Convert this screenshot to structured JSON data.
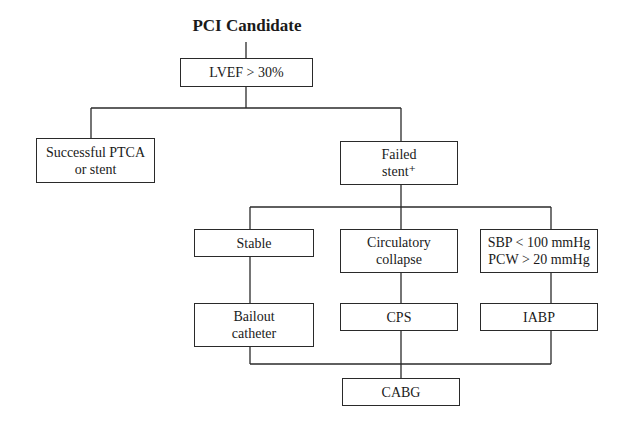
{
  "diagram": {
    "title": "PCI Candidate",
    "nodes": {
      "lvef": "LVEF > 30%",
      "successful": "Successful PTCA\nor stent",
      "failed": "Failed\nstent⁺",
      "stable": "Stable",
      "circulatory": "Circulatory\ncollapse",
      "sbp": "SBP < 100 mmHg\nPCW > 20 mmHg",
      "bailout": "Bailout\ncatheter",
      "cps": "CPS",
      "iabp": "IABP",
      "cabg": "CABG"
    },
    "edges": [
      [
        "title",
        "lvef"
      ],
      [
        "lvef",
        "successful"
      ],
      [
        "lvef",
        "failed"
      ],
      [
        "failed",
        "stable"
      ],
      [
        "failed",
        "circulatory"
      ],
      [
        "failed",
        "sbp"
      ],
      [
        "stable",
        "bailout"
      ],
      [
        "circulatory",
        "cps"
      ],
      [
        "sbp",
        "iabp"
      ],
      [
        "bailout",
        "cabg"
      ],
      [
        "cps",
        "cabg"
      ],
      [
        "iabp",
        "cabg"
      ]
    ]
  }
}
